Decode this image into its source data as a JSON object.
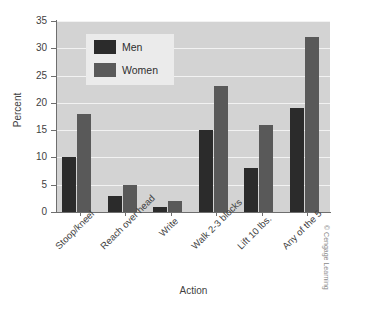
{
  "chart_data": {
    "type": "bar",
    "title": "",
    "xlabel": "Action",
    "ylabel": "Percent",
    "categories": [
      "Stoop/kneel",
      "Reach over head",
      "Write",
      "Walk 2-3 blocks",
      "Lift 10 lbs.",
      "Any of the 5"
    ],
    "series": [
      {
        "name": "Men",
        "values": [
          10,
          3,
          1,
          15,
          8,
          19
        ],
        "color": "#2b2b2b"
      },
      {
        "name": "Women",
        "values": [
          18,
          5,
          2,
          23,
          16,
          32
        ],
        "color": "#595959"
      }
    ],
    "ylim": [
      0,
      35
    ],
    "yticks": [
      0,
      5,
      10,
      15,
      20,
      25,
      30,
      35
    ],
    "ytick_labels": [
      "0",
      "5",
      "10",
      "15",
      "20",
      "25",
      "30",
      "35"
    ],
    "grid": true,
    "grid_color": "#f2f2f2",
    "plot_background": "#d3d3d3",
    "legend_position": "upper-left-inside",
    "legend_background": "#ebebeb"
  },
  "credit": {
    "text": "© Cengage Learning"
  }
}
